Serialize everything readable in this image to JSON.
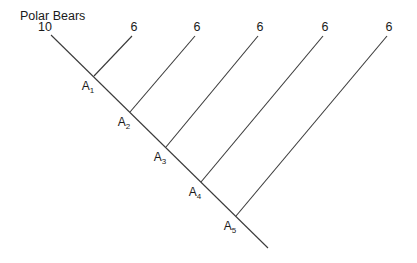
{
  "title": "Polar Bears",
  "root_value": "10",
  "trunk": {
    "x1": 51,
    "y1": 35,
    "x2": 268,
    "y2": 248
  },
  "nodes": [
    {
      "name": "A",
      "sub": "1",
      "x": 94,
      "y": 76,
      "value": "6",
      "tip_x": 132,
      "tip_y": 36
    },
    {
      "name": "A",
      "sub": "2",
      "x": 130,
      "y": 112,
      "value": "6",
      "tip_x": 195,
      "tip_y": 36
    },
    {
      "name": "A",
      "sub": "3",
      "x": 166,
      "y": 147,
      "value": "6",
      "tip_x": 258,
      "tip_y": 36
    },
    {
      "name": "A",
      "sub": "4",
      "x": 201,
      "y": 182,
      "value": "6",
      "tip_x": 323,
      "tip_y": 36
    },
    {
      "name": "A",
      "sub": "5",
      "x": 236,
      "y": 216,
      "value": "6",
      "tip_x": 387,
      "tip_y": 36
    }
  ],
  "colors": {
    "line": "#3a3a3a",
    "text": "#1a1a1a",
    "background": "#ffffff"
  }
}
